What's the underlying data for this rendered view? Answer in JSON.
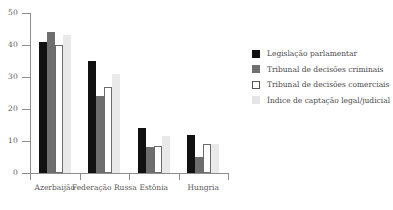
{
  "chart_data": {
    "type": "bar",
    "title": "",
    "subtitle": "",
    "xlabel": "",
    "ylabel": "",
    "ylim": [
      0,
      50
    ],
    "yticks": [
      0,
      10,
      20,
      30,
      40,
      50
    ],
    "grid": false,
    "legend_position": "right",
    "categories": [
      "Azerbaijão",
      "Federação Russa",
      "Estônia",
      "Hungria"
    ],
    "series": [
      {
        "name": "Legislação parlamentar",
        "color": "#111111",
        "values": [
          41,
          35,
          14,
          12
        ]
      },
      {
        "name": "Tribunal de decisões criminais",
        "color": "#6e6e6e",
        "values": [
          44,
          24,
          8,
          5
        ]
      },
      {
        "name": "Tribunal de decisões comerciais",
        "color": "#ffffff",
        "values": [
          40,
          27,
          8.5,
          9
        ]
      },
      {
        "name": "Índice de captação legal/judicial",
        "color": "#e9e9e9",
        "values": [
          43,
          31,
          11.5,
          9
        ]
      }
    ]
  },
  "axis": {
    "y_tick_labels": [
      "0",
      "10",
      "20",
      "30",
      "40",
      "50"
    ]
  },
  "legend": {
    "items": [
      {
        "label": "Legislação parlamentar"
      },
      {
        "label": "Tribunal de decisões criminais"
      },
      {
        "label": "Tribunal de decisões comerciais"
      },
      {
        "label": "Índice de captação legal/judicial"
      }
    ]
  }
}
